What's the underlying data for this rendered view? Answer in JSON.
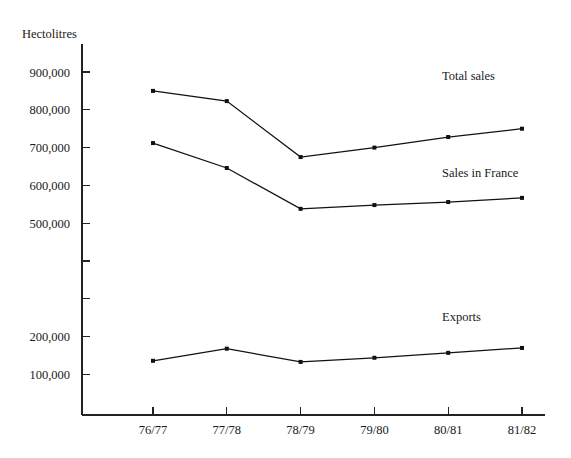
{
  "chart_data": {
    "type": "line",
    "title": "",
    "subtitle": "",
    "xlabel": "",
    "ylabel": "Hectolitres",
    "categories": [
      "76/77",
      "77/78",
      "78/79",
      "79/80",
      "80/81",
      "81/82"
    ],
    "ylim": [
      0,
      950000
    ],
    "ytick_values": [
      100000,
      200000,
      300000,
      400000,
      500000,
      600000,
      700000,
      800000,
      900000
    ],
    "ytick_labels": [
      "100,000",
      "200,000",
      "",
      "",
      "500,000",
      "600,000",
      "700,000",
      "800,000",
      "900,000"
    ],
    "grid": false,
    "legend_position": "inline-right",
    "markers": "dot",
    "series": [
      {
        "name": "Total sales",
        "label": "Total sales",
        "values": [
          850000,
          823000,
          675000,
          700000,
          728000,
          750000
        ],
        "label_x_category": "81/82",
        "label_value": 880000
      },
      {
        "name": "Sales in France",
        "label": "Sales in France",
        "values": [
          712000,
          646000,
          538000,
          548000,
          556000,
          567000
        ],
        "label_x_category": "81/82",
        "label_value": 622000
      },
      {
        "name": "Exports",
        "label": "Exports",
        "values": [
          136000,
          168000,
          133000,
          144000,
          157000,
          170000
        ],
        "label_x_category": "81/82",
        "label_value": 240000
      }
    ],
    "annotations": [
      {
        "text": "Hectolitres",
        "role": "y-axis-title"
      },
      {
        "text": "Total sales",
        "role": "series-label"
      },
      {
        "text": "Sales in France",
        "role": "series-label"
      },
      {
        "text": "Exports",
        "role": "series-label"
      }
    ],
    "colors": {
      "line": "#111111",
      "axis": "#222222",
      "text": "#1a1a1a",
      "background": "#ffffff"
    }
  }
}
